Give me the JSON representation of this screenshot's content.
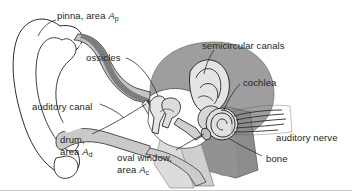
{
  "figure": {
    "type": "anatomical-diagram",
    "width": 352,
    "height": 191,
    "background_color": "#ffffff",
    "border_color": "#c8c8c8",
    "text_color": "#231f20"
  },
  "labels": {
    "pinna": {
      "text": "pinna, area ",
      "symbol": "A",
      "subscript": "p"
    },
    "ossicles": {
      "text": "ossicles"
    },
    "semicircular_canals": {
      "text": "semicircular canals"
    },
    "cochlea": {
      "text": "cochlea"
    },
    "auditory_canal": {
      "text": "auditory canal"
    },
    "drum": {
      "line1": "drum,",
      "line2": "area ",
      "symbol": "A",
      "subscript": "d"
    },
    "oval_window": {
      "line1": "oval window,",
      "line2": "area ",
      "symbol": "A",
      "subscript": "c"
    },
    "auditory_nerve": {
      "text": "auditory nerve"
    },
    "bone": {
      "text": "bone"
    }
  },
  "colors": {
    "outline": "#2b2b2b",
    "bone_fill": "#9a9a9a",
    "bone_fill_dark": "#8a8a8a",
    "tissue_fill": "#c9c9c9",
    "tissue_light": "#d8d8d8",
    "cochlea_fill": "#bdbdbd",
    "canal_fill": "#cfcfcf",
    "white": "#ffffff",
    "leader_line": "#3a3a3a"
  }
}
